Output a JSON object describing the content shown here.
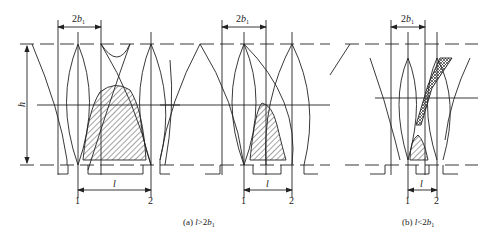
{
  "figure": {
    "panels": [
      {
        "id": "a",
        "caption_prefix": "(a) ",
        "caption_var": "l",
        "caption_rel": ">2",
        "caption_b": "b",
        "caption_sub": "1",
        "width_label": "2b",
        "width_label_num": "2",
        "width_label_var": "b",
        "width_label_sub": "1",
        "length_label": "l",
        "point1": "1",
        "point2": "2"
      },
      {
        "id": "a2",
        "width_label_num": "2",
        "width_label_var": "b",
        "width_label_sub": "1",
        "length_label": "l",
        "point1": "1",
        "point2": "2"
      },
      {
        "id": "b",
        "caption_prefix": "(b) ",
        "caption_var": "l",
        "caption_rel": "<2",
        "caption_b": "b",
        "caption_sub": "1",
        "width_label_num": "2",
        "width_label_var": "b",
        "width_label_sub": "1",
        "length_label": "l",
        "point1": "1",
        "point2": "2"
      }
    ],
    "height_label": "h",
    "colors": {
      "line": "#222222",
      "hatch": "#333333",
      "background": "#ffffff"
    }
  }
}
